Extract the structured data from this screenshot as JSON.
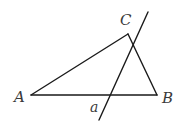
{
  "diagram": {
    "type": "geometry",
    "points": {
      "A": {
        "label": "A",
        "x": 31,
        "y": 95,
        "label_x": 14,
        "label_y": 102
      },
      "B": {
        "label": "B",
        "x": 157,
        "y": 95,
        "label_x": 162,
        "label_y": 103
      },
      "C": {
        "label": "C",
        "x": 128,
        "y": 34,
        "label_x": 120,
        "label_y": 25
      }
    },
    "segments": [
      {
        "name": "AB",
        "from": "A",
        "to": "B"
      },
      {
        "name": "BC",
        "from": "B",
        "to": "C"
      },
      {
        "name": "CA",
        "from": "C",
        "to": "A"
      }
    ],
    "line": {
      "label": "a",
      "x1": 148,
      "y1": 12,
      "x2": 99,
      "y2": 120,
      "label_x": 90,
      "label_y": 112
    },
    "colors": {
      "stroke": "#1a1a1a",
      "label": "#3a3a3a",
      "background": "#ffffff"
    }
  }
}
